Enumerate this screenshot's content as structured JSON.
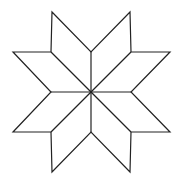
{
  "diagram": {
    "type": "eight-pointed-star",
    "stroke_color": "#222222",
    "fill_color": "#ffffff",
    "center": [
      91,
      92
    ],
    "outer_tips": [
      [
        52,
        12
      ],
      [
        130,
        12
      ],
      [
        170,
        52
      ],
      [
        170,
        132
      ],
      [
        130,
        172
      ],
      [
        52,
        172
      ],
      [
        13,
        52
      ],
      [
        13,
        132
      ]
    ],
    "rhombus_count": 8
  }
}
